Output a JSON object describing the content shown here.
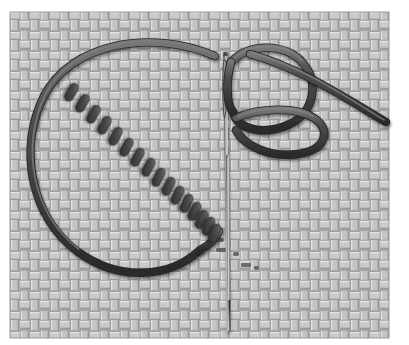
{
  "figure": {
    "title": "Blanket stitch worked with needle and thread on woven fabric",
    "width": 409,
    "height": 345,
    "background_color": "#ffffff"
  },
  "canvas": {
    "margin_left": 10,
    "margin_top": 12,
    "fabric_width": 379,
    "fabric_height": 326
  },
  "fabric": {
    "name": "woven basket-weave ground fabric",
    "base_color": "#b9b9b9",
    "warp_color": "#d7d7d7",
    "weft_color": "#a6a6a6",
    "shadow_color": "#8e8e8e",
    "highlight_color": "#e6e6e6",
    "weave_repeat_px": 20,
    "thread_band_px": 5,
    "border_color": "#9a9a9a"
  },
  "thread": {
    "name": "embroidery thread",
    "core_color": "#4a4a4a",
    "dark_color": "#333333",
    "shade_color": "#2b2b2b",
    "highlight_color": "#7d7d7d",
    "width_px": 7
  },
  "needle": {
    "name": "sewing needle",
    "body_color": "#3a3a3a",
    "metal_color": "#6e6e6e",
    "highlight_color": "#cfcfcf",
    "eye_color": "#a8a8a8",
    "top_y": 52,
    "tip_y": 330,
    "x": 225,
    "width_px": 4,
    "eye_top_y": 58,
    "eye_bottom_y": 120
  },
  "big_loop": {
    "name": "slack thread loop",
    "description": "Large open loop of thread lying on the fabric to the left of the stitching line",
    "path": "M 215,56 C 150,28 70,44 44,96 C 18,148 30,216 78,252 C 120,282 170,278 200,250"
  },
  "working_loop": {
    "name": "working thread loop over needle",
    "description": "Thread loop passing in front of the needle and doubling back to the right",
    "outer_path": "M 231,62 C 250,42 286,44 302,62 C 320,82 314,112 290,124 C 262,138 238,130 234,112",
    "inner_path": "M 236,118 C 258,110 294,108 312,118 C 330,128 326,148 300,152 C 272,156 246,146 238,130"
  },
  "thread_tail": {
    "name": "thread tail to upper right",
    "description": "Free end of thread running off toward the right edge",
    "path": "M 252,56 C 300,70 340,96 388,122"
  },
  "loop_tail": {
    "name": "loop return tail",
    "description": "Lower return of the slack loop travelling up toward the stitch line",
    "path": "M 200,250 C 210,244 216,238 218,230"
  },
  "stitches": {
    "name": "diagonal row of blanket stitches",
    "count": 16,
    "color": "#484848",
    "shade_color": "#2e2e2e",
    "highlight_color": "#787878",
    "length_px": 18,
    "thickness_px": 8,
    "angle_deg": 118,
    "items": [
      {
        "cx": 72,
        "cy": 92,
        "angle": 120
      },
      {
        "cx": 83,
        "cy": 103,
        "angle": 120
      },
      {
        "cx": 94,
        "cy": 114,
        "angle": 119
      },
      {
        "cx": 105,
        "cy": 125,
        "angle": 119
      },
      {
        "cx": 116,
        "cy": 136,
        "angle": 118
      },
      {
        "cx": 127,
        "cy": 147,
        "angle": 118
      },
      {
        "cx": 138,
        "cy": 157,
        "angle": 118
      },
      {
        "cx": 149,
        "cy": 167,
        "angle": 117
      },
      {
        "cx": 159,
        "cy": 177,
        "angle": 117
      },
      {
        "cx": 169,
        "cy": 186,
        "angle": 116
      },
      {
        "cx": 178,
        "cy": 195,
        "angle": 116
      },
      {
        "cx": 187,
        "cy": 203,
        "angle": 115
      },
      {
        "cx": 195,
        "cy": 211,
        "angle": 115
      },
      {
        "cx": 202,
        "cy": 219,
        "angle": 114
      },
      {
        "cx": 209,
        "cy": 226,
        "angle": 114
      },
      {
        "cx": 215,
        "cy": 233,
        "angle": 113
      }
    ]
  },
  "fabric_marks": {
    "name": "puncture marks in fabric",
    "color": "#5a5a5a",
    "items": [
      {
        "x": 216,
        "y": 238,
        "w": 8,
        "h": 4
      },
      {
        "x": 216,
        "y": 248,
        "w": 14,
        "h": 4
      },
      {
        "x": 233,
        "y": 252,
        "w": 6,
        "h": 4
      },
      {
        "x": 241,
        "y": 263,
        "w": 10,
        "h": 4
      },
      {
        "x": 254,
        "y": 266,
        "w": 5,
        "h": 4
      }
    ]
  }
}
